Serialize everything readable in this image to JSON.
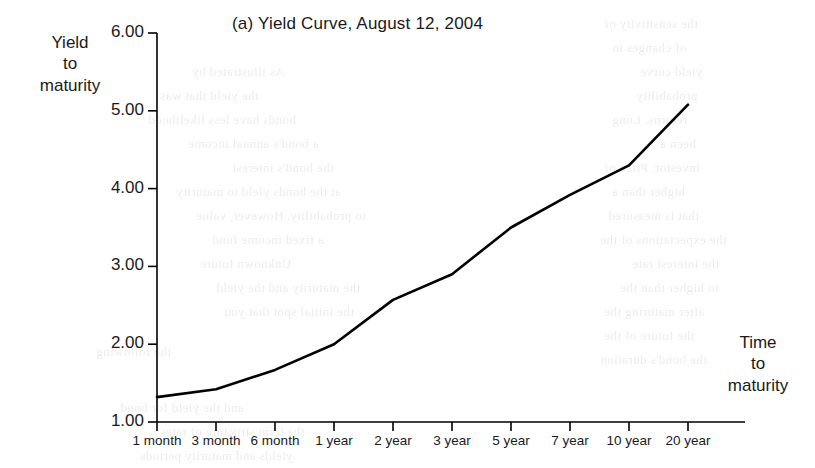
{
  "figure": {
    "title": "(a) Yield Curve, August 12, 2004",
    "y_axis_title_lines": [
      "Yield",
      "to",
      "maturity"
    ],
    "x_axis_title_lines": [
      "Time",
      "to",
      "maturity"
    ]
  },
  "chart_data": {
    "type": "line",
    "title": "(a) Yield Curve, August 12, 2004",
    "xlabel": "Time to maturity",
    "ylabel": "Yield to maturity",
    "categories": [
      "1 month",
      "3 month",
      "6 month",
      "1 year",
      "2 year",
      "3 year",
      "5 year",
      "7 year",
      "10 year",
      "20 year"
    ],
    "values": [
      1.32,
      1.42,
      1.67,
      2.0,
      2.57,
      2.9,
      3.5,
      3.92,
      4.3,
      5.08
    ],
    "ylim": [
      1.0,
      6.0
    ],
    "ytick_labels": [
      "6.00",
      "5.00",
      "4.00",
      "3.00",
      "2.00",
      "1.00"
    ],
    "ytick_values": [
      6.0,
      5.0,
      4.0,
      3.0,
      2.0,
      1.0
    ],
    "grid": false,
    "legend": false,
    "series_color": "#000000"
  },
  "bleed_text": [
    {
      "text": "the sensitivity of",
      "x": 604,
      "y": 16
    },
    {
      "text": "of changes in",
      "x": 612,
      "y": 40
    },
    {
      "text": "As illustrated by",
      "x": 192,
      "y": 64
    },
    {
      "text": "yield curve",
      "x": 640,
      "y": 64
    },
    {
      "text": "the yield that was",
      "x": 160,
      "y": 88
    },
    {
      "text": "probability",
      "x": 636,
      "y": 88
    },
    {
      "text": "bonds have less likelihood",
      "x": 148,
      "y": 112
    },
    {
      "text": "returns. Long",
      "x": 612,
      "y": 112
    },
    {
      "text": "a bond's annual income",
      "x": 188,
      "y": 136
    },
    {
      "text": "been a",
      "x": 660,
      "y": 136
    },
    {
      "text": "the bond's interest",
      "x": 232,
      "y": 160
    },
    {
      "text": "investor. Price of",
      "x": 604,
      "y": 160
    },
    {
      "text": "at the bonds yield to maturity",
      "x": 176,
      "y": 184
    },
    {
      "text": "higher than a",
      "x": 612,
      "y": 184
    },
    {
      "text": "to probability. However, value",
      "x": 196,
      "y": 208
    },
    {
      "text": "that is measured",
      "x": 608,
      "y": 208
    },
    {
      "text": "a fixed income fund",
      "x": 212,
      "y": 232
    },
    {
      "text": "the expectations of the",
      "x": 600,
      "y": 232
    },
    {
      "text": "the interest rate",
      "x": 632,
      "y": 256
    },
    {
      "text": "Unknown future",
      "x": 200,
      "y": 256
    },
    {
      "text": "the maturity and the yield",
      "x": 216,
      "y": 280
    },
    {
      "text": "to higher than the",
      "x": 620,
      "y": 280
    },
    {
      "text": "the initial spot that you",
      "x": 224,
      "y": 304
    },
    {
      "text": "after maturing the",
      "x": 604,
      "y": 304
    },
    {
      "text": "the future of the",
      "x": 604,
      "y": 328
    },
    {
      "text": "the following",
      "x": 96,
      "y": 344
    },
    {
      "text": "the bond's duration",
      "x": 600,
      "y": 352
    },
    {
      "text": "and the yield for bond",
      "x": 120,
      "y": 400
    },
    {
      "text": "the term structure of rates",
      "x": 160,
      "y": 424
    },
    {
      "text": "yields and maturity periods",
      "x": 140,
      "y": 448
    }
  ]
}
